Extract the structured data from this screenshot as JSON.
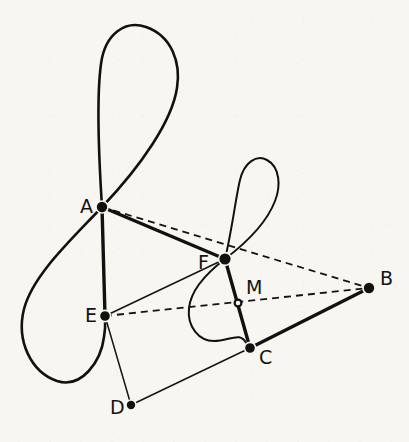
{
  "figure": {
    "kind": "geometric-construction-diagram",
    "background_color": "#f8f6f1",
    "ink_color": "#111111",
    "width": 409,
    "height": 442,
    "vertices": [
      {
        "id": "A",
        "label": "A",
        "x": 102,
        "y": 207,
        "label_x": 80,
        "label_y": 213,
        "marker": "filled",
        "radius": 6.0
      },
      {
        "id": "B",
        "label": "B",
        "x": 369,
        "y": 288,
        "label_x": 380,
        "label_y": 285,
        "marker": "filled",
        "radius": 6.0
      },
      {
        "id": "C",
        "label": "C",
        "x": 250,
        "y": 348,
        "label_x": 259,
        "label_y": 364,
        "marker": "filled",
        "radius": 5.6
      },
      {
        "id": "D",
        "label": "D",
        "x": 131,
        "y": 405,
        "label_x": 110,
        "label_y": 414,
        "marker": "filled",
        "radius": 5.0
      },
      {
        "id": "E",
        "label": "E",
        "x": 105,
        "y": 316,
        "label_x": 85,
        "label_y": 322,
        "marker": "filled",
        "radius": 5.6
      },
      {
        "id": "F",
        "label": "F",
        "x": 225,
        "y": 259,
        "label_x": 198,
        "label_y": 269,
        "marker": "filled",
        "radius": 6.4
      },
      {
        "id": "M",
        "label": "M",
        "x": 238,
        "y": 303,
        "label_x": 246,
        "label_y": 294,
        "marker": "open",
        "radius": 3.4
      }
    ],
    "edges": [
      {
        "id": "A-F",
        "from": "A",
        "to": "F",
        "style": "thick",
        "note": "solid heavy segment"
      },
      {
        "id": "A-E",
        "from": "A",
        "to": "E",
        "style": "thick",
        "note": "solid heavy segment"
      },
      {
        "id": "F-C",
        "from": "F",
        "to": "C",
        "style": "thick",
        "note": "solid heavy segment"
      },
      {
        "id": "C-B",
        "from": "C",
        "to": "B",
        "style": "thick",
        "note": "solid heavy segment"
      },
      {
        "id": "E-F",
        "from": "E",
        "to": "F",
        "style": "thin",
        "note": "solid light segment"
      },
      {
        "id": "E-D",
        "from": "E",
        "to": "D",
        "style": "thin",
        "note": "solid light segment"
      },
      {
        "id": "D-C",
        "from": "D",
        "to": "C",
        "style": "thin",
        "note": "solid light segment"
      },
      {
        "id": "A-B",
        "from": "A",
        "to": "B",
        "style": "dashed",
        "note": "dashed construction line"
      },
      {
        "id": "E-B",
        "from": "E",
        "to": "B",
        "style": "dashed",
        "note": "dashed construction line through M"
      }
    ],
    "curves": [
      {
        "id": "large-figure-eight",
        "kind": "lemniscate-loop",
        "node_vertex": "A",
        "cusp_vertex": "E",
        "stroke_width": 2.6,
        "path": "M 102 207 C 99 160 96 100 101 64 C 105 33 126 20 146 27 C 172 36 181 63 177 88 C 172 121 141 166 102 207 C 70 241 33 275 24 309 C 16 341 31 372 57 381 C 82 389 101 361 104 337 C 106 325 105 320 105 316"
      },
      {
        "id": "small-figure-eight",
        "kind": "lemniscate-loop",
        "node_vertex": "F",
        "cusp_vertex": "C",
        "stroke_width": 2.0,
        "path": "M 225 259 C 232 230 236 196 240 180 C 244 163 256 154 267 160 C 280 167 281 186 275 201 C 267 222 246 243 225 259 C 208 272 191 289 189 308 C 187 327 199 341 214 341 C 230 341 241 330 247 345 C 248 347 249 348 250 348"
      }
    ]
  }
}
